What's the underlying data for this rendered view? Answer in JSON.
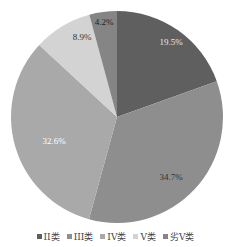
{
  "chart_data": {
    "type": "pie",
    "title": "",
    "categories": [
      "II类",
      "III类",
      "IV类",
      "V类",
      "劣V类"
    ],
    "values": [
      19.5,
      34.7,
      32.6,
      8.9,
      4.2
    ],
    "labels": [
      "19.5%",
      "34.7%",
      "32.6%",
      "8.9%",
      "4.2%"
    ],
    "colors": [
      "#5f5f5f",
      "#8e8e8e",
      "#a9a9a9",
      "#d3d3d3",
      "#858585"
    ],
    "label_colors": [
      "#e8e8e8",
      "#333333",
      "#ffffff",
      "#333333",
      "#222222"
    ],
    "start_angle_deg": 0,
    "direction": "clockwise",
    "legend_position": "bottom"
  },
  "legend": {
    "items": [
      {
        "label": "II类"
      },
      {
        "label": "III类"
      },
      {
        "label": "IV类"
      },
      {
        "label": "V类"
      },
      {
        "label": "劣V类"
      }
    ]
  }
}
